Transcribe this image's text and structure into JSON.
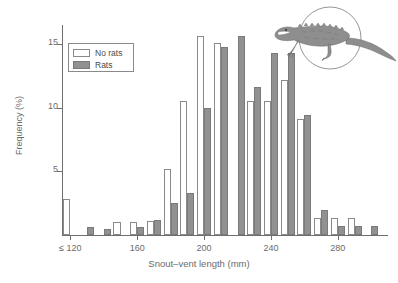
{
  "chart_data": {
    "type": "bar",
    "title": "",
    "subtitle": "",
    "xlabel": "Snout–vent length (mm)",
    "ylabel": "Frequency (%)",
    "xlim": [
      115,
      310
    ],
    "ylim": [
      0,
      16.5
    ],
    "grid": false,
    "legend_position": "top-left",
    "x_tick_labels": [
      "≤ 120",
      "160",
      "200",
      "240",
      "280"
    ],
    "x_tick_values": [
      120,
      160,
      200,
      240,
      280
    ],
    "y_tick_labels": [
      "5",
      "10",
      "15"
    ],
    "y_tick_values": [
      5,
      10,
      15
    ],
    "bin_width": 10,
    "categories": [
      120,
      130,
      140,
      150,
      160,
      170,
      180,
      190,
      200,
      210,
      220,
      230,
      240,
      250,
      260,
      270,
      280,
      290,
      300
    ],
    "series": [
      {
        "name": "No rats",
        "color": "#ffffff",
        "edge_color": "#8a8a8a",
        "values": [
          2.8,
          0,
          0,
          1.0,
          1.0,
          1.1,
          5.2,
          10.5,
          15.6,
          15.1,
          0,
          10.5,
          10.5,
          12.2,
          9.1,
          1.3,
          1.3,
          1.3,
          0
        ]
      },
      {
        "name": "Rats",
        "color": "#919191",
        "edge_color": "#7a7a7a",
        "values": [
          0,
          0.6,
          0.5,
          0,
          0.6,
          1.2,
          2.5,
          3.3,
          10.0,
          14.8,
          15.6,
          11.6,
          14.3,
          14.3,
          9.4,
          2.0,
          0.7,
          0.7,
          0.7
        ]
      }
    ],
    "annotations": [
      {
        "name": "lizard-illustration",
        "description": "tuatara lizard inside circle"
      }
    ]
  },
  "legend": {
    "items": [
      {
        "label": "No rats",
        "swatch": "norats"
      },
      {
        "label": "Rats",
        "swatch": "rats"
      }
    ]
  }
}
